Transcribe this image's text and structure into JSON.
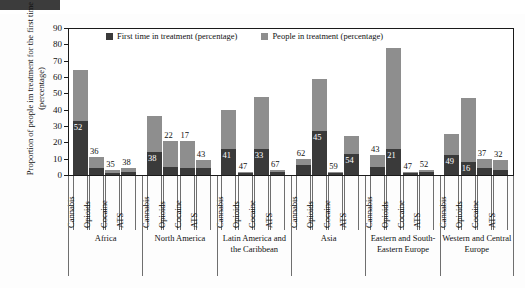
{
  "chart_data": {
    "type": "bar",
    "title": "",
    "subtype": "stacked-bar",
    "xlabel": "",
    "ylabel": "Proportion of people im treatment for the first time (percentage)",
    "ylim": [
      0,
      90
    ],
    "yticks": [
      0,
      10,
      20,
      30,
      40,
      50,
      60,
      70,
      80,
      90
    ],
    "grid": false,
    "legend_position": "top-inside",
    "legend": [
      {
        "label": "First time in treatment (percentage)",
        "color": "#3a3a3a"
      },
      {
        "label": "People in treatment (percentage)",
        "color": "#8e8e8e"
      }
    ],
    "categories": [
      "Cannabis",
      "Opioids",
      "Cocaine",
      "ATS"
    ],
    "groups": [
      {
        "region": "Africa",
        "bars": [
          {
            "category": "Cannabis",
            "people_in_treatment": 64,
            "first_time": 33,
            "label": "52"
          },
          {
            "category": "Opioids",
            "people_in_treatment": 11,
            "first_time": 4,
            "label": "36"
          },
          {
            "category": "Cocaine",
            "people_in_treatment": 3,
            "first_time": 1,
            "label": "35"
          },
          {
            "category": "ATS",
            "people_in_treatment": 4,
            "first_time": 2,
            "label": "38"
          }
        ]
      },
      {
        "region": "North America",
        "bars": [
          {
            "category": "Cannabis",
            "people_in_treatment": 36,
            "first_time": 14,
            "label": "38"
          },
          {
            "category": "Opioids",
            "people_in_treatment": 21,
            "first_time": 5,
            "label": "22"
          },
          {
            "category": "Cocaine",
            "people_in_treatment": 21,
            "first_time": 4,
            "label": "17"
          },
          {
            "category": "ATS",
            "people_in_treatment": 9,
            "first_time": 4,
            "label": "43"
          }
        ]
      },
      {
        "region": "Latin America and the Caribbean",
        "bars": [
          {
            "category": "Cannabis",
            "people_in_treatment": 40,
            "first_time": 16,
            "label": "41"
          },
          {
            "category": "Opioids",
            "people_in_treatment": 2,
            "first_time": 1,
            "label": "47"
          },
          {
            "category": "Cocaine",
            "people_in_treatment": 48,
            "first_time": 16,
            "label": "33"
          },
          {
            "category": "ATS",
            "people_in_treatment": 3,
            "first_time": 2,
            "label": "67"
          }
        ]
      },
      {
        "region": "Asia",
        "bars": [
          {
            "category": "Cannabis",
            "people_in_treatment": 10,
            "first_time": 6,
            "label": "62"
          },
          {
            "category": "Opioids",
            "people_in_treatment": 59,
            "first_time": 27,
            "label": "45"
          },
          {
            "category": "Cocaine",
            "people_in_treatment": 2,
            "first_time": 1,
            "label": "59"
          },
          {
            "category": "ATS",
            "people_in_treatment": 24,
            "first_time": 13,
            "label": "54"
          }
        ]
      },
      {
        "region": "Eastern and South-Eastern Europe",
        "bars": [
          {
            "category": "Cannabis",
            "people_in_treatment": 12,
            "first_time": 5,
            "label": "43"
          },
          {
            "category": "Opioids",
            "people_in_treatment": 78,
            "first_time": 16,
            "label": "21"
          },
          {
            "category": "Cocaine",
            "people_in_treatment": 2,
            "first_time": 1,
            "label": "47"
          },
          {
            "category": "ATS",
            "people_in_treatment": 3,
            "first_time": 2,
            "label": "52"
          }
        ]
      },
      {
        "region": "Western and Central Europe",
        "bars": [
          {
            "category": "Cannabis",
            "people_in_treatment": 25,
            "first_time": 12,
            "label": "49"
          },
          {
            "category": "Opioids",
            "people_in_treatment": 47,
            "first_time": 8,
            "label": "16"
          },
          {
            "category": "Cocaine",
            "people_in_treatment": 10,
            "first_time": 4,
            "label": "37"
          },
          {
            "category": "ATS",
            "people_in_treatment": 9,
            "first_time": 3,
            "label": "32"
          }
        ]
      }
    ]
  },
  "colors": {
    "first_time": "#3a3a3a",
    "people": "#8e8e8e",
    "axis": "#1a1a1a"
  }
}
